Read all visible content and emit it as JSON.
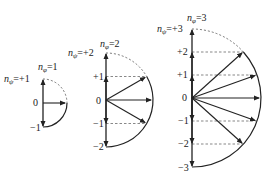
{
  "diagrams": [
    {
      "name": "n_phi_1",
      "n_phi_label": "n",
      "n_phi_sub": "φ",
      "n_phi_value": "=1",
      "n_psi_label": "n",
      "n_psi_sub": "ψ",
      "n_psi_value": "=+1",
      "ticks": [
        "0",
        "−1"
      ]
    },
    {
      "name": "n_phi_2",
      "n_phi_label": "n",
      "n_phi_sub": "φ",
      "n_phi_value": "=2",
      "n_psi_label": "n",
      "n_psi_sub": "ψ",
      "n_psi_value": "=+2",
      "ticks": [
        "+1",
        "0",
        "−1",
        "−2"
      ]
    },
    {
      "name": "n_phi_3",
      "n_phi_label": "n",
      "n_phi_sub": "φ",
      "n_phi_value": "=3",
      "n_psi_label": "n",
      "n_psi_sub": "ψ",
      "n_psi_value": "=+3",
      "ticks": [
        "+2",
        "+1",
        "0",
        "−1",
        "−2",
        "−3"
      ]
    }
  ],
  "colors": {
    "line": "#222222",
    "dashed": "#555555",
    "background": "#ffffff"
  }
}
